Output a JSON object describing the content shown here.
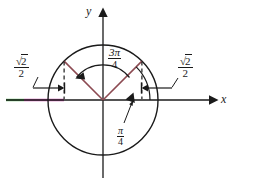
{
  "figure": {
    "axes": {
      "x_label": "x",
      "y_label": "y"
    },
    "labels": {
      "left_value_numerator_radical": "√",
      "left_value_numerator_arg": "2",
      "left_value_denominator": "2",
      "right_value_numerator_radical": "√",
      "right_value_numerator_arg": "2",
      "right_value_denominator": "2",
      "main_angle_numerator": "3π",
      "main_angle_denominator": "4",
      "reference_angle_numerator": "π",
      "reference_angle_denominator": "4"
    },
    "colors": {
      "axis": "#1a1a1a",
      "circle": "#1a1a1a",
      "radius_line": "#8c4a52",
      "highlight_green": "#4caf50",
      "highlight_magenta": "#cc44aa",
      "dashed": "#1a1a1a"
    },
    "geometry": {
      "center_x": 103,
      "center_y": 100,
      "radius": 55,
      "main_angle_degrees": 135,
      "reference_angle_degrees": 45
    }
  }
}
